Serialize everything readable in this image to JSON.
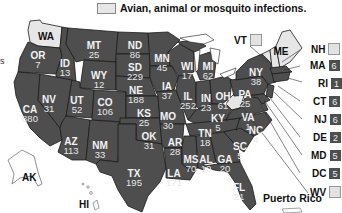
{
  "legend": {
    "label": "Avian, animal or mosquito infections.",
    "swatch_color": "#e6e6e6"
  },
  "colors": {
    "human_cases_fill": "#4e4e4e",
    "animal_only_fill": "#e6e6e6",
    "border": "#1a1a1a",
    "label_text": "#f2f2f2"
  },
  "edge_fragment": "s",
  "states": {
    "WA": {
      "abbr": "WA",
      "count": null,
      "status": "animal_only"
    },
    "OR": {
      "abbr": "OR",
      "count": "7"
    },
    "CA": {
      "abbr": "CA",
      "count": "880"
    },
    "ID": {
      "abbr": "ID",
      "count": "13"
    },
    "NV": {
      "abbr": "NV",
      "count": "31"
    },
    "MT": {
      "abbr": "MT",
      "count": "25"
    },
    "WY": {
      "abbr": "WY",
      "count": "12"
    },
    "UT": {
      "abbr": "UT",
      "count": "52"
    },
    "CO": {
      "abbr": "CO",
      "count": "106"
    },
    "AZ": {
      "abbr": "AZ",
      "count": "113"
    },
    "NM": {
      "abbr": "NM",
      "count": "33"
    },
    "ND": {
      "abbr": "ND",
      "count": "86"
    },
    "SD": {
      "abbr": "SD",
      "count": "229"
    },
    "NE": {
      "abbr": "NE",
      "count": "188"
    },
    "KS": {
      "abbr": "KS",
      "count": "25"
    },
    "OK": {
      "abbr": "OK",
      "count": "31"
    },
    "TX": {
      "abbr": "TX",
      "count": "195"
    },
    "MN": {
      "abbr": "MN",
      "count": "45"
    },
    "IA": {
      "abbr": "IA",
      "count": "37"
    },
    "MO": {
      "abbr": "MO",
      "count": "30"
    },
    "AR": {
      "abbr": "AR",
      "count": "28"
    },
    "LA": {
      "abbr": "LA",
      "count": "171"
    },
    "WI": {
      "abbr": "WI",
      "count": "17"
    },
    "IL": {
      "abbr": "IL",
      "count": "252"
    },
    "MI": {
      "abbr": "MI",
      "count": "62"
    },
    "IN": {
      "abbr": "IN",
      "count": "23"
    },
    "OH": {
      "abbr": "OH",
      "count": "61"
    },
    "KY": {
      "abbr": "KY",
      "count": "5"
    },
    "TN": {
      "abbr": "TN",
      "count": "18"
    },
    "MS": {
      "abbr": "MS",
      "count": "70"
    },
    "AL": {
      "abbr": "AL",
      "count": "10"
    },
    "GA": {
      "abbr": "GA",
      "count": "20"
    },
    "FL": {
      "abbr": "FL",
      "count": "21"
    },
    "SC": {
      "abbr": "SC",
      "count": "5"
    },
    "NC": {
      "abbr": "NC",
      "count": "4"
    },
    "VA": {
      "abbr": "VA",
      "count": "1"
    },
    "PA": {
      "abbr": "PA",
      "count": "25"
    },
    "NY": {
      "abbr": "NY",
      "count": "38"
    },
    "ME": {
      "abbr": "ME",
      "count": null,
      "status": "animal_only"
    },
    "AK": {
      "abbr": "AK",
      "count": null
    },
    "HI": {
      "abbr": "HI",
      "count": null
    }
  },
  "callouts": {
    "VT": {
      "abbr": "VT",
      "count": "",
      "status": "animal_only"
    },
    "NH": {
      "abbr": "NH",
      "count": "",
      "status": "animal_only"
    },
    "MA": {
      "abbr": "MA",
      "count": "6"
    },
    "RI": {
      "abbr": "RI",
      "count": "1"
    },
    "CT": {
      "abbr": "CT",
      "count": "6"
    },
    "NJ": {
      "abbr": "NJ",
      "count": "6"
    },
    "DE": {
      "abbr": "DE",
      "count": "2"
    },
    "MD": {
      "abbr": "MD",
      "count": "5"
    },
    "DC": {
      "abbr": "DC",
      "count": "5"
    },
    "WV": {
      "abbr": "WV",
      "count": "",
      "status": "animal_only"
    }
  },
  "territories": {
    "puerto_rico": "Puerto Rico"
  }
}
